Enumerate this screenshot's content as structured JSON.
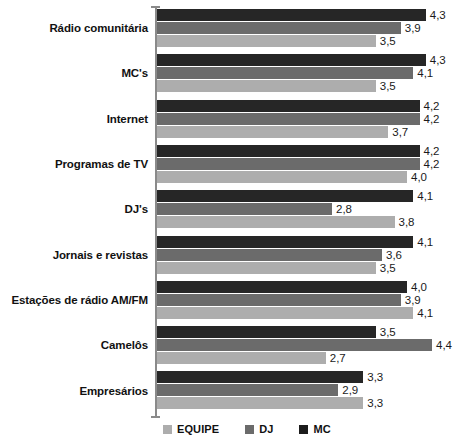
{
  "chart_data": {
    "type": "bar",
    "orientation": "horizontal",
    "title": "",
    "subtitle": "",
    "xlabel": "",
    "ylabel": "",
    "xlim": [
      0,
      4.75
    ],
    "grid": false,
    "legend_position": "bottom",
    "categories": [
      "Rádio comunitária",
      "MC's",
      "Internet",
      "Programas de TV",
      "DJ's",
      "Jornais e revistas",
      "Estações de rádio AM/FM",
      "Camelôs",
      "Empresários"
    ],
    "series": [
      {
        "name": "MC",
        "color": "#262626",
        "values": [
          4.3,
          4.3,
          4.2,
          4.2,
          4.1,
          4.1,
          4.0,
          3.5,
          3.3
        ],
        "labels": [
          "4,3",
          "4,3",
          "4,2",
          "4,2",
          "4,1",
          "4,1",
          "4,0",
          "3,5",
          "3,3"
        ]
      },
      {
        "name": "DJ",
        "color": "#6b6b6b",
        "values": [
          3.9,
          4.1,
          4.2,
          4.2,
          2.8,
          3.6,
          3.9,
          4.4,
          2.9
        ],
        "labels": [
          "3,9",
          "4,1",
          "4,2",
          "4,2",
          "2,8",
          "3,6",
          "3,9",
          "4,4",
          "2,9"
        ]
      },
      {
        "name": "EQUIPE",
        "color": "#adadad",
        "values": [
          3.5,
          3.5,
          3.7,
          4.0,
          3.8,
          3.5,
          4.1,
          2.7,
          3.3
        ],
        "labels": [
          "3,5",
          "3,5",
          "3,7",
          "4,0",
          "3,8",
          "3,5",
          "4,1",
          "2,7",
          "3,3"
        ]
      }
    ],
    "legend": [
      {
        "label": "EQUIPE",
        "color": "#adadad"
      },
      {
        "label": "DJ",
        "color": "#6b6b6b"
      },
      {
        "label": "MC",
        "color": "#1c1c1c"
      }
    ]
  }
}
